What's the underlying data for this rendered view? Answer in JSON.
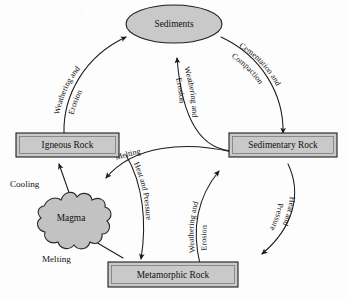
{
  "diagram": {
    "colors": {
      "node_fill": "#c9c9c9",
      "magma_fill": "#c2c2c2",
      "stroke": "#1a1a1a",
      "background": "#fdfdfd",
      "text": "#111111"
    },
    "nodes": [
      {
        "id": "sediments",
        "label": "Sediments",
        "shape": "ellipse"
      },
      {
        "id": "igneous",
        "label": "Igneous Rock",
        "shape": "rectangle"
      },
      {
        "id": "sedimentary",
        "label": "Sedimentary Rock",
        "shape": "rectangle"
      },
      {
        "id": "metamorphic",
        "label": "Metamorphic Rock",
        "shape": "rectangle"
      },
      {
        "id": "magma",
        "label": "Magma",
        "shape": "blob"
      }
    ],
    "edges": [
      {
        "id": "igneous-to-sediments",
        "from": "Igneous Rock",
        "to": "Sediments",
        "label_line1": "Weathering and",
        "label_line2": "Erosion",
        "orientation": "curved-up-right"
      },
      {
        "id": "sediments-to-sedimentary",
        "from": "Sediments",
        "to": "Sedimentary Rock",
        "label_line1": "Cementation and",
        "label_line2": "Compaction",
        "orientation": "curved-down-right"
      },
      {
        "id": "sedimentary-to-sediments",
        "from": "Sedimentary Rock",
        "to": "Sediments",
        "label_line1": "Weathering and",
        "label_line2": "Erosion",
        "orientation": "inverted-vertical"
      },
      {
        "id": "metamorphic-to-sediments",
        "from": "Metamorphic Rock",
        "to": "Sedimentary Rock",
        "label_line1": "Weathering and",
        "label_line2": "Erosion",
        "orientation": "vertical-right"
      },
      {
        "id": "sedimentary-to-metamorphic",
        "from": "Sedimentary Rock",
        "to": "Metamorphic Rock",
        "label_line1": "Heat and",
        "label_line2": "Pressure",
        "orientation": "curved-down-left"
      },
      {
        "id": "igneous-to-metamorphic",
        "from": "Igneous Rock",
        "to": "Metamorphic Rock",
        "label_line1": "Heat and Pressure",
        "label_line2": "",
        "orientation": "curved-down"
      },
      {
        "id": "sedimentary-to-magma",
        "from": "Sedimentary Rock",
        "to": "Magma",
        "label_line1": "Melting",
        "label_line2": "",
        "orientation": "curved-left"
      },
      {
        "id": "magma-to-igneous",
        "from": "Magma",
        "to": "Igneous Rock",
        "label_line1": "Cooling",
        "label_line2": "",
        "orientation": "straight-up"
      },
      {
        "id": "metamorphic-to-magma",
        "from": "Metamorphic Rock",
        "to": "Magma",
        "label_line1": "Melting",
        "label_line2": "",
        "orientation": "straight-left"
      }
    ]
  }
}
